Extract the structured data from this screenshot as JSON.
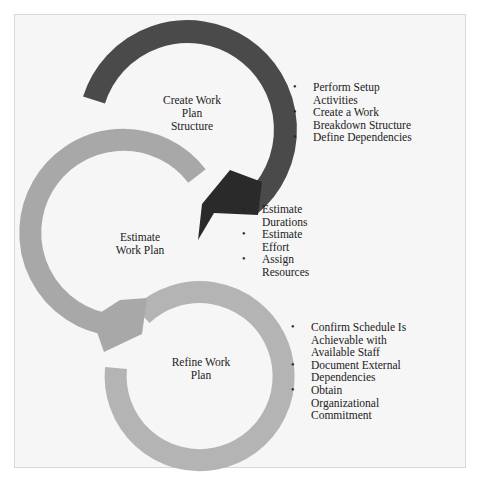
{
  "diagram": {
    "colors": {
      "background": "#f6f6f6",
      "frame_border": "#d8d8d8",
      "step1_arc": "#4a4a4a",
      "step2_arc": "#a8a8a8",
      "step3_arc": "#b4b4b4",
      "text": "#222222"
    },
    "steps": [
      {
        "label": "Create Work Plan Structure",
        "label_lines": [
          "Create Work",
          "Plan",
          "Structure"
        ],
        "bullets": [
          "Perform Setup Activities",
          "Create a Work Breakdown Structure",
          "Define Dependencies"
        ]
      },
      {
        "label": "Estimate Work Plan",
        "label_lines": [
          "Estimate",
          "Work Plan"
        ],
        "bullets": [
          "Estimate Durations",
          "Estimate Effort",
          "Assign Resources"
        ]
      },
      {
        "label": "Refine Work Plan",
        "label_lines": [
          "Refine Work",
          "Plan"
        ],
        "bullets": [
          "Confirm Schedule Is Achievable with Available Staff",
          "Document External Dependencies",
          "Obtain Organizational Commitment"
        ]
      }
    ]
  }
}
